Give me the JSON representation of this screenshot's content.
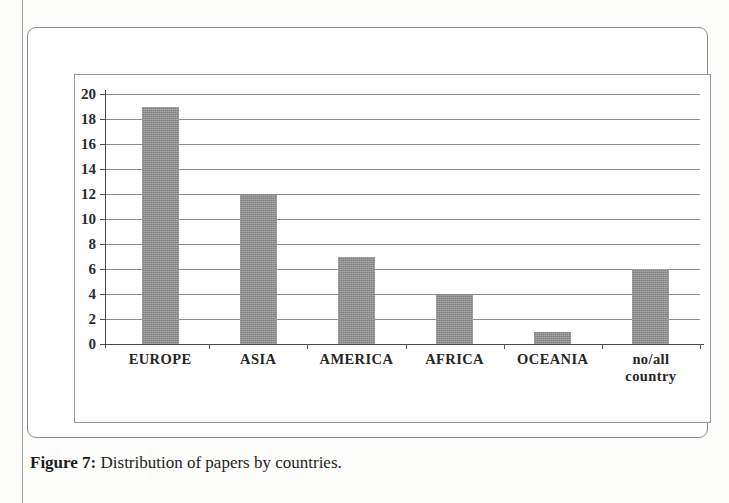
{
  "figure": {
    "caption_label": "Figure 7:",
    "caption_text": "Distribution of papers by countries."
  },
  "chart_data": {
    "type": "bar",
    "title": "",
    "xlabel": "",
    "ylabel": "",
    "categories": [
      "EUROPE",
      "ASIA",
      "AMERICA",
      "AFRICA",
      "OCEANIA",
      "no/all\ncountry"
    ],
    "values": [
      19,
      12,
      7,
      4,
      1,
      6
    ],
    "ylim": [
      0,
      20
    ],
    "ytick_labels": [
      "20",
      "18",
      "16",
      "14",
      "12",
      "10",
      "8",
      "6",
      "4",
      "2",
      "0"
    ],
    "ytick_values": [
      20,
      18,
      16,
      14,
      12,
      10,
      8,
      6,
      4,
      2,
      0
    ],
    "grid": true,
    "legend": false,
    "bar_color": "#8d8d8d",
    "axis_color": "#4a4a4a",
    "gridline_color": "#8d8d8d"
  }
}
